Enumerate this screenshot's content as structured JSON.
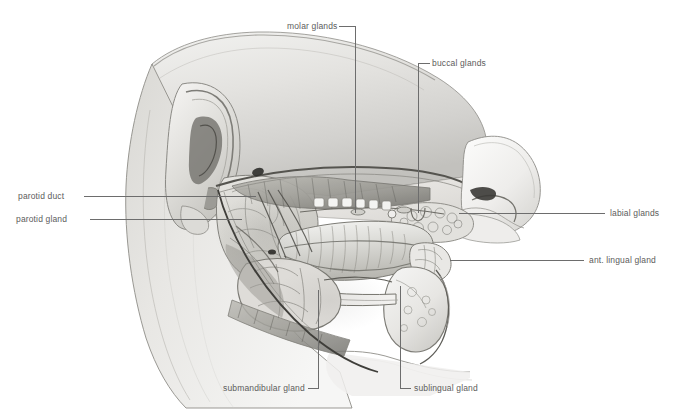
{
  "figure": {
    "background_color": "#ffffff",
    "line_color": "#6d6d6d",
    "text_color": "#5c5c5c",
    "width": 682,
    "height": 414
  },
  "labels": [
    {
      "id": "molar-glands",
      "text": "molar glands"
    },
    {
      "id": "buccal-glands",
      "text": "buccal glands"
    },
    {
      "id": "parotid-duct",
      "text": "parotid duct"
    },
    {
      "id": "parotid-gland",
      "text": "parotid gland"
    },
    {
      "id": "labial-glands",
      "text": "labial glands"
    },
    {
      "id": "ant-lingual-gland",
      "text": "ant. lingual gland"
    },
    {
      "id": "submandibular-gland",
      "text": "submandibular gland"
    },
    {
      "id": "sublingual-gland",
      "text": "sublingual gland"
    }
  ]
}
